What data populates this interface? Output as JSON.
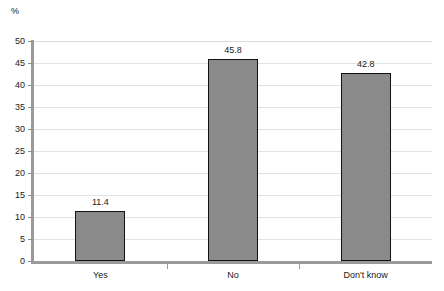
{
  "chart_data": {
    "type": "bar",
    "title": "",
    "xlabel": "",
    "ylabel": "%",
    "categories": [
      "Yes",
      "No",
      "Don't know"
    ],
    "values": [
      11.4,
      45.8,
      42.8
    ],
    "value_labels": [
      "11.4",
      "45.8",
      "42.8"
    ],
    "ylim": [
      0,
      50
    ],
    "ytick_step": 5,
    "ytick_labels": [
      "0",
      "5",
      "10",
      "15",
      "20",
      "25",
      "30",
      "35",
      "40",
      "45",
      "50"
    ],
    "grid": true,
    "legend": "none",
    "bar_fill_color": "#8a8a8a",
    "bar_border_color": "#121212",
    "gridline_color": "#e2e2e2",
    "axis_color": "#9a9a9a",
    "background_color": "#ffffff"
  }
}
